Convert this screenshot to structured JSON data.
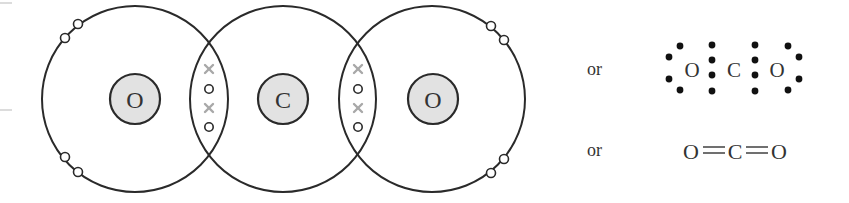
{
  "diagram": {
    "colors": {
      "shell": "#2a2a2a",
      "nucleus_fill": "#e2e2e2",
      "cross_electron": "#a8a8a8",
      "dot_electron": "#111111"
    },
    "atoms": [
      {
        "symbol": "O",
        "role": "oxygen-left"
      },
      {
        "symbol": "C",
        "role": "carbon"
      },
      {
        "symbol": "O",
        "role": "oxygen-right"
      }
    ],
    "shared_pairs": [
      {
        "between": "O-C",
        "electrons": [
          "×",
          "○",
          "×",
          "○"
        ]
      },
      {
        "between": "C-O",
        "electrons": [
          "×",
          "○",
          "×",
          "○"
        ]
      }
    ],
    "lone_pairs_per_oxygen": 2,
    "alternatives": [
      {
        "connector": "or",
        "type": "lewis-dot",
        "symbols": [
          "O",
          "C",
          "O"
        ]
      },
      {
        "connector": "or",
        "type": "structural-formula",
        "symbols": [
          "O",
          "C",
          "O"
        ],
        "bonds": [
          "=",
          "="
        ]
      }
    ]
  }
}
